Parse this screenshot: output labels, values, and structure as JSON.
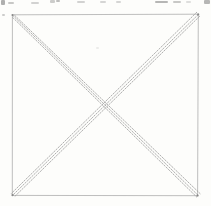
{
  "canvas": {
    "width": 211,
    "height": 206,
    "background": "#fdfdfb"
  },
  "sketch": {
    "name": "square-with-crossed-diagonals",
    "outline_color": "#a7a7a7",
    "diagonal_color": "#979797",
    "corner_dot_color": "#6f6f6f",
    "fragment_color": "#707070",
    "square": {
      "points": [
        [
          12.4,
          14.8
        ],
        [
          198.3,
          14.2
        ],
        [
          197.6,
          195.7
        ],
        [
          12.3,
          195.4
        ]
      ]
    },
    "diagonals": [
      {
        "name": "diagonal-tl-br",
        "strokes": [
          {
            "x1": 12.6,
            "y1": 15.2,
            "x2": 198.8,
            "y2": 196.0
          },
          {
            "x1": 14.4,
            "y1": 15.1,
            "x2": 200.4,
            "y2": 193.9
          },
          {
            "x1": 12.4,
            "y1": 17.2,
            "x2": 197.0,
            "y2": 197.3
          }
        ]
      },
      {
        "name": "diagonal-tr-bl",
        "strokes": [
          {
            "x1": 198.4,
            "y1": 14.4,
            "x2": 12.6,
            "y2": 195.3
          },
          {
            "x1": 199.9,
            "y1": 16.0,
            "x2": 14.2,
            "y2": 197.0
          },
          {
            "x1": 197.0,
            "y1": 12.0,
            "x2": 11.0,
            "y2": 193.8
          }
        ]
      }
    ],
    "corner_dots": [
      [
        12.5,
        15.0
      ],
      [
        198.2,
        14.4
      ],
      [
        197.6,
        195.6
      ],
      [
        12.5,
        195.2
      ]
    ],
    "top_text_fragments": [
      {
        "x": 1,
        "y": 0,
        "w": 4,
        "h": 5,
        "o": 0.55
      },
      {
        "x": 8,
        "y": 2,
        "w": 6,
        "h": 2,
        "o": 0.38
      },
      {
        "x": 31,
        "y": 2,
        "w": 8,
        "h": 2,
        "o": 0.3
      },
      {
        "x": 50,
        "y": 0,
        "w": 5,
        "h": 3,
        "o": 0.35
      },
      {
        "x": 56,
        "y": 0,
        "w": 4,
        "h": 2,
        "o": 0.45
      },
      {
        "x": 77,
        "y": 1,
        "w": 8,
        "h": 2,
        "o": 0.3
      },
      {
        "x": 100,
        "y": 1,
        "w": 6,
        "h": 2,
        "o": 0.28
      },
      {
        "x": 116,
        "y": 1,
        "w": 5,
        "h": 2,
        "o": 0.28
      },
      {
        "x": 155,
        "y": 1,
        "w": 13,
        "h": 2,
        "o": 0.5
      },
      {
        "x": 173,
        "y": 1,
        "w": 8,
        "h": 2,
        "o": 0.38
      },
      {
        "x": 186,
        "y": 1,
        "w": 5,
        "h": 2,
        "o": 0.22
      },
      {
        "x": 204,
        "y": 0,
        "w": 6,
        "h": 4,
        "o": 0.5
      }
    ],
    "stray_marks": [
      {
        "x": 2,
        "y": 14,
        "w": 3,
        "h": 2,
        "o": 0.35
      },
      {
        "x": 96,
        "y": 47,
        "w": 3,
        "h": 2,
        "o": 0.12
      }
    ]
  }
}
